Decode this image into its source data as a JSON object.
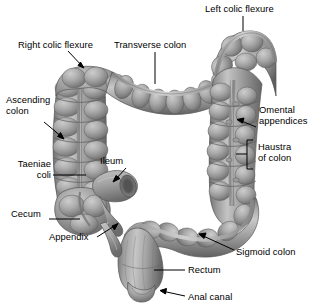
{
  "figure": {
    "background_color": "#ffffff",
    "style": "grayscale-3d-anatomical-illustration",
    "text_color": "#000000",
    "leader_line_color": "#000000"
  },
  "labels": [
    {
      "id": "left-colic-flexure",
      "text": "Left colic flexure",
      "align": "left",
      "x": 205,
      "y": 3,
      "leader": {
        "type": "line",
        "from": [
          243,
          16
        ],
        "to": [
          243,
          31
        ]
      }
    },
    {
      "id": "right-colic-flexure",
      "text": "Right colic flexure",
      "align": "left",
      "x": 18,
      "y": 39,
      "leader": {
        "type": "arrow",
        "from": [
          68,
          51
        ],
        "to": [
          84,
          68
        ]
      }
    },
    {
      "id": "transverse-colon",
      "text": "Transverse colon",
      "align": "left",
      "x": 114,
      "y": 39,
      "leader": {
        "type": "line",
        "from": [
          155,
          52
        ],
        "to": [
          155,
          83
        ]
      }
    },
    {
      "id": "ascending-colon",
      "text": "Ascending\ncolon",
      "align": "left",
      "x": 6,
      "y": 94,
      "leader": {
        "type": "arrow",
        "from": [
          44,
          122
        ],
        "to": [
          64,
          138
        ]
      }
    },
    {
      "id": "omental-appendices",
      "text": "Omental\nappendices",
      "align": "left",
      "x": 259,
      "y": 104,
      "leader": {
        "type": "arrow",
        "from": [
          256,
          127
        ],
        "to": [
          237,
          120
        ]
      }
    },
    {
      "id": "haustra-of-colon",
      "text": "Haustra\nof colon",
      "align": "left",
      "x": 258,
      "y": 141,
      "leader": {
        "type": "bracket",
        "x": 248,
        "top": 140,
        "bottom": 169,
        "tick_y": 154,
        "tick_to_x": 236
      }
    },
    {
      "id": "taeniae-coli",
      "text": "Taeniae\ncoli",
      "align": "right",
      "x": 5,
      "y": 158,
      "width": 46,
      "leader": {
        "type": "line",
        "from": [
          53,
          175
        ],
        "to": [
          86,
          175
        ]
      }
    },
    {
      "id": "ileum",
      "text": "Ileum",
      "align": "left",
      "x": 100,
      "y": 155,
      "leader": {
        "type": "arrow",
        "from": [
          126,
          168
        ],
        "to": [
          113,
          182
        ]
      }
    },
    {
      "id": "cecum",
      "text": "Cecum",
      "align": "left",
      "x": 11,
      "y": 208,
      "leader": {
        "type": "line",
        "from": [
          49,
          219
        ],
        "to": [
          78,
          219
        ]
      }
    },
    {
      "id": "appendix",
      "text": "Appendix",
      "align": "left",
      "x": 49,
      "y": 231,
      "leader": {
        "type": "arrow",
        "from": [
          97,
          237
        ],
        "to": [
          118,
          223
        ]
      }
    },
    {
      "id": "sigmoid-colon",
      "text": "Sigmoid colon",
      "align": "left",
      "x": 236,
      "y": 246,
      "leader": {
        "type": "arrow",
        "from": [
          234,
          250
        ],
        "to": [
          199,
          234
        ]
      }
    },
    {
      "id": "rectum",
      "text": "Rectum",
      "align": "left",
      "x": 188,
      "y": 264,
      "leader": {
        "type": "line",
        "from": [
          185,
          270
        ],
        "to": [
          154,
          270
        ]
      }
    },
    {
      "id": "anal-canal",
      "text": "Anal canal",
      "align": "left",
      "x": 188,
      "y": 291,
      "leader": {
        "type": "arrow",
        "from": [
          185,
          296
        ],
        "to": [
          160,
          290
        ]
      }
    }
  ],
  "anatomy_parts": [
    {
      "id": "cecum",
      "name": "Cecum"
    },
    {
      "id": "appendix",
      "name": "Appendix"
    },
    {
      "id": "ileum",
      "name": "Ileum"
    },
    {
      "id": "ascending-colon",
      "name": "Ascending colon"
    },
    {
      "id": "right-colic-flexure",
      "name": "Right colic flexure"
    },
    {
      "id": "transverse-colon",
      "name": "Transverse colon"
    },
    {
      "id": "left-colic-flexure",
      "name": "Left colic flexure"
    },
    {
      "id": "descending-colon",
      "name": "Descending colon"
    },
    {
      "id": "sigmoid-colon",
      "name": "Sigmoid colon"
    },
    {
      "id": "rectum",
      "name": "Rectum"
    },
    {
      "id": "anal-canal",
      "name": "Anal canal"
    },
    {
      "id": "taeniae-coli",
      "name": "Taeniae coli"
    },
    {
      "id": "haustra",
      "name": "Haustra of colon"
    },
    {
      "id": "omental-appendices",
      "name": "Omental appendices"
    }
  ],
  "palette": {
    "tissue_light": "#c9c9c9",
    "tissue_mid": "#a3a3a3",
    "tissue_base": "#8e8e8e",
    "tissue_shadow": "#6f6f6f",
    "tissue_deep_shadow": "#555555",
    "groove": "#5e5e5e",
    "highlight": "#dcdcdc",
    "outline": "#4a4a4a"
  }
}
